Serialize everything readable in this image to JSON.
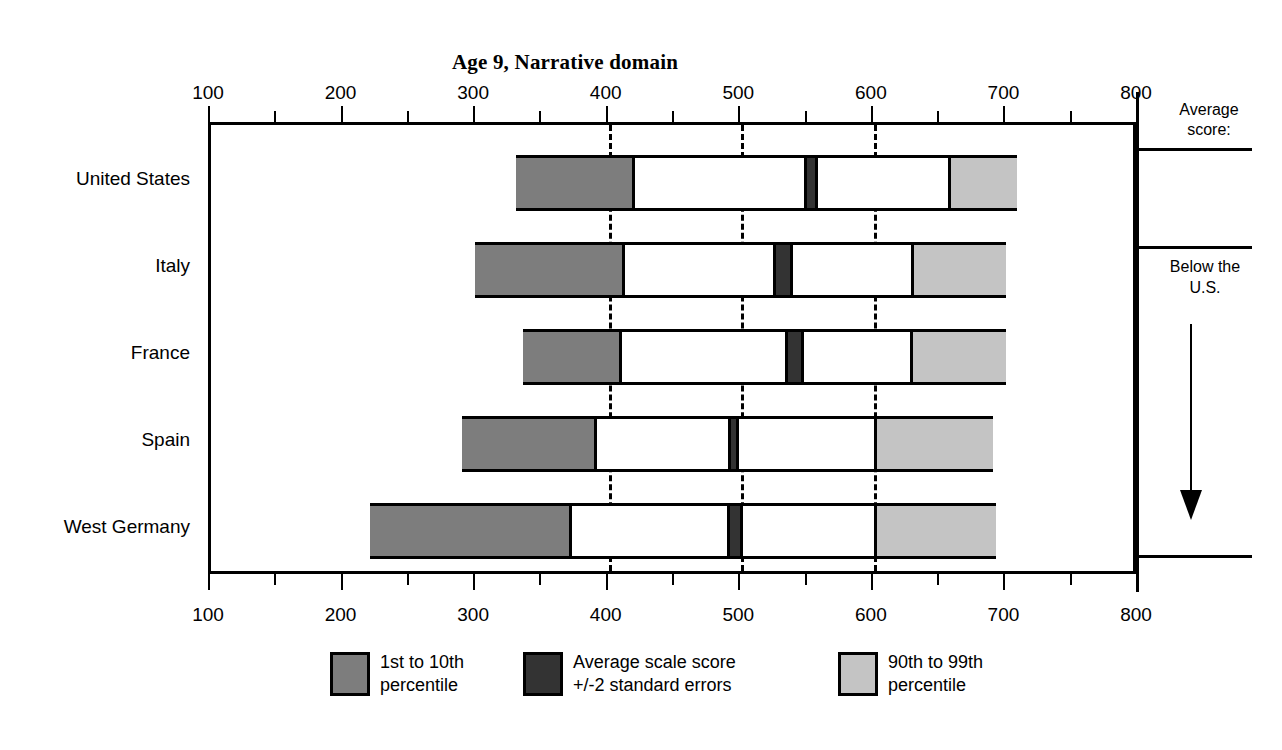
{
  "chart_data": {
    "type": "bar",
    "title": "Age 9, Narrative domain",
    "xlabel": "",
    "ylabel": "",
    "xlim": [
      100,
      800
    ],
    "x_ticks": [
      100,
      200,
      300,
      400,
      500,
      600,
      700,
      800
    ],
    "x_tick_labels": [
      "100",
      "200",
      "300",
      "400",
      "500",
      "600",
      "700",
      "800"
    ],
    "minor_tick_step": 50,
    "gridlines": [
      400,
      500,
      600
    ],
    "grid": "dashed vertical at 400, 500, 600",
    "legend_position": "bottom",
    "categories": [
      "United States",
      "Italy",
      "France",
      "Spain",
      "West Germany"
    ],
    "series": [
      {
        "name": "1st to 10th percentile",
        "color": "#7d7d7d",
        "ranges": [
          {
            "category": "United States",
            "start": 330,
            "end": 420
          },
          {
            "category": "Italy",
            "start": 299,
            "end": 412
          },
          {
            "category": "France",
            "start": 335,
            "end": 410
          },
          {
            "category": "Spain",
            "start": 289,
            "end": 391
          },
          {
            "category": "West Germany",
            "start": 220,
            "end": 372
          }
        ]
      },
      {
        "name": "Average scale score +/-2 standard errors",
        "color": "#333333",
        "ranges": [
          {
            "category": "United States",
            "start": 547,
            "end": 558
          },
          {
            "category": "Italy",
            "start": 524,
            "end": 539
          },
          {
            "category": "France",
            "start": 533,
            "end": 547
          },
          {
            "category": "Spain",
            "start": 490,
            "end": 498
          },
          {
            "category": "West Germany",
            "start": 489,
            "end": 501
          }
        ]
      },
      {
        "name": "90th to 99th percentile",
        "color": "#c4c4c4",
        "ranges": [
          {
            "category": "United States",
            "start": 656,
            "end": 708
          },
          {
            "category": "Italy",
            "start": 628,
            "end": 700
          },
          {
            "category": "France",
            "start": 627,
            "end": 700
          },
          {
            "category": "Spain",
            "start": 600,
            "end": 690
          },
          {
            "category": "West Germany",
            "start": 600,
            "end": 692
          }
        ]
      }
    ],
    "bars": [
      {
        "category": "United States",
        "p1": 330,
        "p10": 420,
        "avg_low": 547,
        "avg_high": 558,
        "p90": 656,
        "p99": 708
      },
      {
        "category": "Italy",
        "p1": 299,
        "p10": 412,
        "avg_low": 524,
        "avg_high": 539,
        "p90": 628,
        "p99": 700
      },
      {
        "category": "France",
        "p1": 335,
        "p10": 410,
        "avg_low": 533,
        "avg_high": 547,
        "p90": 627,
        "p99": 700
      },
      {
        "category": "Spain",
        "p1": 289,
        "p10": 391,
        "avg_low": 490,
        "avg_high": 498,
        "p90": 600,
        "p99": 690
      },
      {
        "category": "West Germany",
        "p1": 220,
        "p10": 372,
        "avg_low": 489,
        "avg_high": 501,
        "p90": 600,
        "p99": 692
      }
    ]
  },
  "title": "Age 9, Narrative domain",
  "axis": {
    "labels": [
      "100",
      "200",
      "300",
      "400",
      "500",
      "600",
      "700",
      "800"
    ]
  },
  "countries": [
    {
      "label": "United States"
    },
    {
      "label": "Italy"
    },
    {
      "label": "France"
    },
    {
      "label": "Spain"
    },
    {
      "label": "West Germany"
    }
  ],
  "right_panel": {
    "heading": "Average\nscore:",
    "heading_line1": "Average",
    "heading_line2": "score:",
    "note_line1": "Below the",
    "note_line2": "U.S.",
    "arrow": "down-arrow"
  },
  "legend": [
    {
      "label_line1": "1st to 10th",
      "label_line2": "percentile",
      "color": "#7d7d7d",
      "swatch": "swatch-low"
    },
    {
      "label_line1": "Average scale score",
      "label_line2": "+/-2 standard errors",
      "color": "#333333",
      "swatch": "swatch-mid"
    },
    {
      "label_line1": "90th to 99th",
      "label_line2": "percentile",
      "color": "#c4c4c4",
      "swatch": "swatch-high"
    }
  ]
}
